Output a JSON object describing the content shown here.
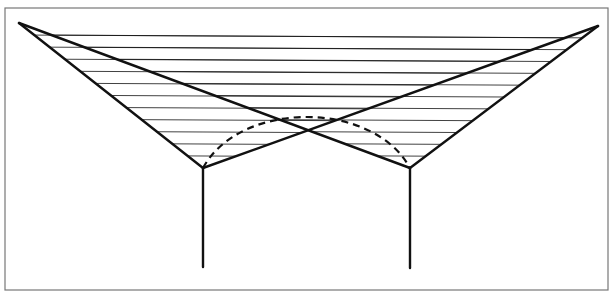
{
  "diagram": {
    "type": "hyperbolic-paraboloid-umbrella-structure",
    "canvas": {
      "width": 614,
      "height": 299,
      "background": "#ffffff"
    },
    "frame": {
      "x": 5,
      "y": 8,
      "width": 603,
      "height": 282,
      "stroke": "#777777",
      "stroke_width": 1.2
    },
    "colors": {
      "line": "#111111"
    },
    "points": {
      "left_tip": [
        19,
        23
      ],
      "right_tip": [
        598,
        26
      ],
      "left_vertex": [
        203,
        168
      ],
      "right_vertex": [
        410,
        168
      ],
      "left_post_bottom": [
        203,
        267
      ],
      "right_post_bottom": [
        410,
        268
      ]
    },
    "heavy_edges": [
      [
        "left_tip",
        "left_vertex"
      ],
      [
        "left_vertex",
        "right_tip"
      ],
      [
        "right_tip",
        "right_vertex"
      ],
      [
        "right_vertex",
        "left_tip"
      ],
      [
        "left_vertex",
        "left_post_bottom"
      ],
      [
        "right_vertex",
        "right_post_bottom"
      ]
    ],
    "heavy_stroke_width": 2.4,
    "rulings": [
      {
        "name": "left-hypar-rulings",
        "edge_a": [
          "left_tip",
          "left_vertex"
        ],
        "edge_b": [
          "right_tip",
          "left_vertex"
        ],
        "count": 12
      },
      {
        "name": "right-hypar-rulings",
        "edge_a": [
          "right_tip",
          "right_vertex"
        ],
        "edge_b": [
          "left_tip",
          "right_vertex"
        ],
        "count": 12
      }
    ],
    "ruling_stroke_width": 0.8,
    "dashed_arc": {
      "start": "left_vertex",
      "end": "right_vertex",
      "control1": [
        240,
        100
      ],
      "control2": [
        373,
        100
      ],
      "dash": "7 5",
      "stroke_width": 2.2
    }
  }
}
